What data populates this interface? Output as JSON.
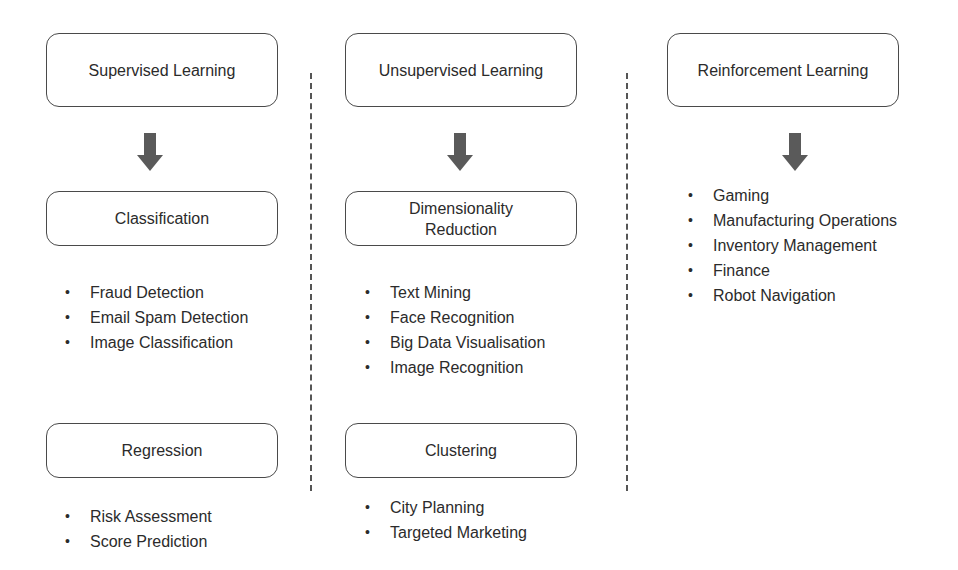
{
  "columns": [
    {
      "title": "Supervised Learning",
      "groups": [
        {
          "title": "Classification",
          "items": [
            "Fraud Detection",
            "Email Spam Detection",
            "Image Classification"
          ]
        },
        {
          "title": "Regression",
          "items": [
            "Risk Assessment",
            "Score Prediction"
          ]
        }
      ]
    },
    {
      "title": "Unsupervised Learning",
      "groups": [
        {
          "title": "Dimensionality Reduction",
          "items": [
            "Text Mining",
            "Face Recognition",
            "Big Data Visualisation",
            "Image Recognition"
          ]
        },
        {
          "title": "Clustering",
          "items": [
            "City Planning",
            "Targeted Marketing"
          ]
        }
      ]
    },
    {
      "title": "Reinforcement Learning",
      "groups": [
        {
          "title": "",
          "items": [
            "Gaming",
            "Manufacturing Operations",
            "Inventory Management",
            "Finance",
            "Robot Navigation"
          ]
        }
      ]
    }
  ],
  "colors": {
    "box_border": "#4a4a4a",
    "arrow": "#5a5a5a",
    "divider": "#555555",
    "text": "#2b2b2b"
  }
}
